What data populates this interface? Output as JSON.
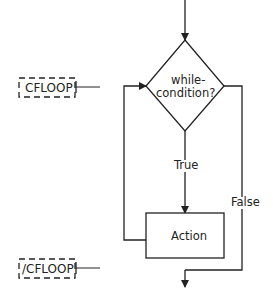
{
  "diagram": {
    "type": "flowchart",
    "title": "",
    "colors": {
      "stroke": "#222222",
      "background": "#ffffff"
    },
    "tags": {
      "open_tag": "CFLOOP",
      "close_tag": "/CFLOOP"
    },
    "decision": {
      "line1": "while-",
      "line2": "condition?"
    },
    "process": {
      "label": "Action"
    },
    "edges": {
      "true_label": "True",
      "false_label": "False"
    }
  }
}
